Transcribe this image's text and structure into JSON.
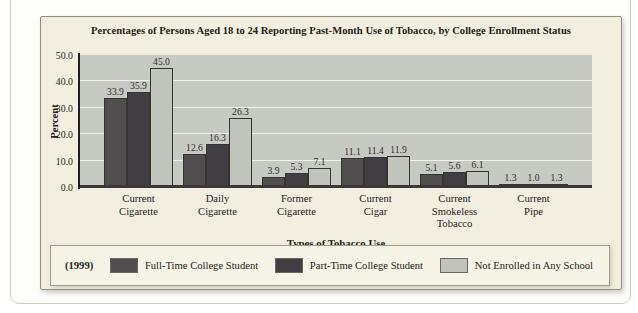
{
  "figure": {
    "title": "Percentages of Persons Aged 18 to 24 Reporting Past-Month Use of Tobacco, by College Enrollment Status",
    "y_axis_title": "Percent",
    "x_axis_title": "Types of Tobacco Use",
    "year_label": "(1999)"
  },
  "chart_data": {
    "type": "bar",
    "title": "Percentages of Persons Aged 18 to 24 Reporting Past-Month Use of Tobacco, by College Enrollment Status",
    "xlabel": "Types of Tobacco Use",
    "ylabel": "Percent",
    "ylim": [
      0,
      50
    ],
    "yticks": [
      0,
      10,
      20,
      30,
      40,
      50
    ],
    "ytick_labels": [
      "0.0",
      "10.0",
      "20.0",
      "30.0",
      "40.0",
      "50.0"
    ],
    "grid": true,
    "legend_position": "bottom",
    "year_annotation": "(1999)",
    "categories": [
      "Current Cigarette",
      "Daily Cigarette",
      "Former Cigarette",
      "Current Cigar",
      "Current Smokeless Tobacco",
      "Current Pipe"
    ],
    "categories_display_lines": [
      [
        "Current",
        "Cigarette"
      ],
      [
        "Daily",
        "Cigarette"
      ],
      [
        "Former",
        "Cigarette"
      ],
      [
        "Current",
        "Cigar"
      ],
      [
        "Current",
        "Smokeless",
        "Tobacco"
      ],
      [
        "Current",
        "Pipe"
      ]
    ],
    "series": [
      {
        "name": "Full-Time College Student",
        "color": "#514e4f",
        "values": [
          33.9,
          12.6,
          3.9,
          11.1,
          5.1,
          1.3
        ]
      },
      {
        "name": "Part-Time College Student",
        "color": "#413f44",
        "values": [
          35.9,
          16.3,
          5.3,
          11.4,
          5.6,
          1.0
        ]
      },
      {
        "name": "Not Enrolled in Any School",
        "color": "#c1c4bc",
        "values": [
          45.0,
          26.3,
          7.1,
          11.9,
          6.1,
          1.3
        ]
      }
    ]
  },
  "colors": {
    "page_background": "#ffffff",
    "card_background": "#fdfdfa",
    "panel_background": "#f2efe1",
    "plot_background": "#c7c9c3",
    "gridline": "#eef0eb",
    "axis": "#21201e",
    "bar_outline": "#37342f"
  }
}
